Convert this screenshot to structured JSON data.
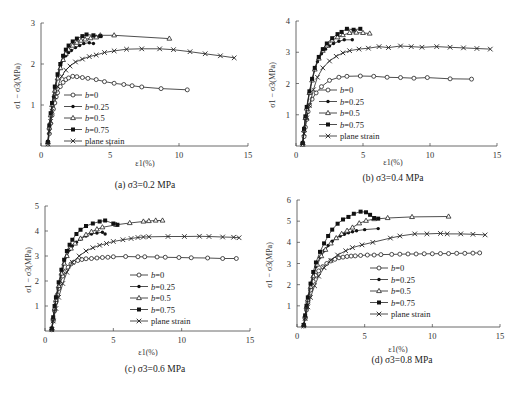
{
  "figure_caption": "",
  "chart_data": [
    {
      "id": "a",
      "type": "line",
      "title": "(a) σ3=0.2 MPa",
      "xlabel": "ε1(%)",
      "ylabel": "σ1 − σ3(MPa)",
      "xlim": [
        0,
        15
      ],
      "ylim": [
        0,
        3
      ],
      "xticks": [
        0,
        5,
        10,
        15
      ],
      "yticks": [
        1,
        2,
        3
      ],
      "grid": false,
      "legend_position": "lower-left-inside",
      "px": {
        "x0": 41,
        "x1": 248,
        "y0": 146,
        "y1": 23
      },
      "series": [
        {
          "name": "b=0",
          "marker": "open-circle",
          "x": [
            0.5,
            0.6,
            0.7,
            0.8,
            0.9,
            1.0,
            1.1,
            1.2,
            1.4,
            1.6,
            1.8,
            2.0,
            2.3,
            2.6,
            3.0,
            3.4,
            4.0,
            4.6,
            5.3,
            6.0,
            6.6,
            7.3,
            8.7,
            10.6
          ],
          "y": [
            0.05,
            0.3,
            0.55,
            0.75,
            0.9,
            1.05,
            1.2,
            1.3,
            1.45,
            1.55,
            1.62,
            1.66,
            1.7,
            1.69,
            1.67,
            1.65,
            1.62,
            1.57,
            1.53,
            1.5,
            1.47,
            1.44,
            1.4,
            1.37
          ]
        },
        {
          "name": "b=0.25",
          "marker": "filled-circle",
          "x": [
            0.5,
            0.6,
            0.7,
            0.8,
            0.9,
            1.0,
            1.2,
            1.4,
            1.6,
            1.8,
            2.0,
            2.2,
            2.5,
            2.8,
            3.1,
            3.5,
            3.8
          ],
          "y": [
            0.1,
            0.45,
            0.75,
            1.0,
            1.2,
            1.4,
            1.7,
            1.95,
            2.1,
            2.2,
            2.28,
            2.33,
            2.4,
            2.45,
            2.5,
            2.52,
            2.5
          ]
        },
        {
          "name": "b=0.5",
          "marker": "open-triangle",
          "x": [
            0.5,
            0.6,
            0.7,
            0.8,
            1.0,
            1.2,
            1.4,
            1.6,
            1.8,
            2.0,
            2.3,
            2.6,
            2.9,
            3.2,
            3.6,
            4.0,
            4.3,
            5.3,
            9.3
          ],
          "y": [
            0.1,
            0.45,
            0.75,
            1.0,
            1.35,
            1.65,
            1.9,
            2.1,
            2.25,
            2.35,
            2.45,
            2.52,
            2.57,
            2.6,
            2.63,
            2.65,
            2.7,
            2.7,
            2.62
          ]
        },
        {
          "name": "b=0.75",
          "marker": "filled-square",
          "x": [
            0.5,
            0.6,
            0.7,
            0.8,
            1.0,
            1.2,
            1.4,
            1.6,
            1.8,
            2.0,
            2.3,
            2.6,
            3.0,
            3.3,
            3.8,
            4.3
          ],
          "y": [
            0.1,
            0.5,
            0.8,
            1.05,
            1.45,
            1.75,
            2.0,
            2.2,
            2.35,
            2.45,
            2.55,
            2.62,
            2.68,
            2.72,
            2.7,
            2.68
          ]
        },
        {
          "name": "plane strain",
          "marker": "cross",
          "x": [
            0.5,
            0.6,
            0.7,
            0.8,
            1.0,
            1.2,
            1.5,
            1.8,
            2.1,
            2.5,
            3.0,
            3.5,
            4.0,
            4.6,
            5.3,
            6.2,
            7.3,
            8.6,
            9.6,
            10.8,
            11.9,
            13.0,
            14.0
          ],
          "y": [
            0.05,
            0.35,
            0.6,
            0.85,
            1.2,
            1.45,
            1.7,
            1.85,
            1.95,
            2.05,
            2.12,
            2.18,
            2.22,
            2.28,
            2.32,
            2.36,
            2.37,
            2.37,
            2.35,
            2.3,
            2.25,
            2.2,
            2.15
          ]
        }
      ]
    },
    {
      "id": "b",
      "type": "line",
      "title": "(b) σ3=0.4 MPa",
      "xlabel": "ε1(%)",
      "ylabel": "σ1 − σ3(MPa)",
      "xlim": [
        0,
        15
      ],
      "ylim": [
        0,
        4
      ],
      "xticks": [
        0,
        5,
        10,
        15
      ],
      "yticks": [
        1,
        2,
        3,
        4
      ],
      "grid": false,
      "legend_position": "lower-left-inside",
      "px": {
        "x0": 296,
        "x1": 497,
        "y0": 146,
        "y1": 21
      },
      "series": [
        {
          "name": "b=0",
          "marker": "open-circle",
          "x": [
            0.5,
            0.6,
            0.7,
            0.8,
            0.9,
            1.0,
            1.2,
            1.5,
            1.9,
            2.5,
            3.2,
            3.8,
            4.8,
            5.8,
            6.8,
            7.8,
            8.8,
            9.8,
            11.5,
            13.1
          ],
          "y": [
            0.05,
            0.3,
            0.6,
            0.85,
            1.1,
            1.3,
            1.5,
            1.7,
            1.9,
            2.1,
            2.2,
            2.23,
            2.24,
            2.23,
            2.2,
            2.19,
            2.17,
            2.19,
            2.15,
            2.14
          ]
        },
        {
          "name": "b=0.25",
          "marker": "filled-circle",
          "x": [
            0.5,
            0.6,
            0.7,
            0.8,
            1.0,
            1.2,
            1.4,
            1.6,
            1.9,
            2.2,
            2.5,
            2.8,
            3.2,
            3.6,
            4.2
          ],
          "y": [
            0.1,
            0.5,
            0.9,
            1.2,
            1.7,
            2.1,
            2.45,
            2.7,
            2.95,
            3.1,
            3.2,
            3.28,
            3.35,
            3.4,
            3.4
          ]
        },
        {
          "name": "b=0.5",
          "marker": "open-triangle",
          "x": [
            0.5,
            0.6,
            0.7,
            0.8,
            1.0,
            1.2,
            1.4,
            1.7,
            2.0,
            2.3,
            2.7,
            3.1,
            3.5,
            4.0,
            4.5,
            5.0,
            5.5
          ],
          "y": [
            0.1,
            0.5,
            0.9,
            1.2,
            1.7,
            2.1,
            2.45,
            2.8,
            3.05,
            3.22,
            3.38,
            3.48,
            3.55,
            3.62,
            3.63,
            3.62,
            3.6
          ]
        },
        {
          "name": "b=0.75",
          "marker": "filled-square",
          "x": [
            0.5,
            0.6,
            0.7,
            0.8,
            1.0,
            1.2,
            1.4,
            1.7,
            2.0,
            2.3,
            2.7,
            3.1,
            3.4,
            3.8,
            4.3,
            4.8
          ],
          "y": [
            0.1,
            0.55,
            0.95,
            1.25,
            1.75,
            2.15,
            2.5,
            2.85,
            3.1,
            3.28,
            3.45,
            3.58,
            3.65,
            3.75,
            3.72,
            3.75
          ]
        },
        {
          "name": "plane strain",
          "marker": "cross",
          "x": [
            0.5,
            0.6,
            0.8,
            1.0,
            1.3,
            1.6,
            2.0,
            2.5,
            3.0,
            3.5,
            4.0,
            4.7,
            5.4,
            6.2,
            6.9,
            7.8,
            8.6,
            9.4,
            10.5,
            11.5,
            12.5,
            13.5,
            14.5
          ],
          "y": [
            0.05,
            0.4,
            0.9,
            1.3,
            1.8,
            2.2,
            2.5,
            2.72,
            2.87,
            2.98,
            3.05,
            3.1,
            3.13,
            3.18,
            3.15,
            3.2,
            3.18,
            3.16,
            3.18,
            3.16,
            3.14,
            3.12,
            3.1
          ]
        }
      ]
    },
    {
      "id": "c",
      "type": "line",
      "title": "(c) σ3=0.6 MPa",
      "xlabel": "ε1(%)",
      "ylabel": "σ1 − σ3(MPa)",
      "xlim": [
        0,
        15
      ],
      "ylim": [
        0,
        5
      ],
      "xticks": [
        0,
        5,
        10,
        15
      ],
      "yticks": [
        1,
        2,
        3,
        4,
        5
      ],
      "grid": false,
      "legend_position": "lower-right-inside",
      "px": {
        "x0": 45,
        "x1": 250,
        "y0": 331,
        "y1": 206
      },
      "series": [
        {
          "name": "b=0",
          "marker": "open-circle",
          "x": [
            0.5,
            0.6,
            0.7,
            0.8,
            0.9,
            1.0,
            1.1,
            1.3,
            1.5,
            1.7,
            1.9,
            2.1,
            2.4,
            2.7,
            3.0,
            3.4,
            3.8,
            4.2,
            4.6,
            5.0,
            5.9,
            6.8,
            7.3,
            8.2,
            8.8,
            9.8,
            10.7,
            11.9,
            13.0,
            14.0
          ],
          "y": [
            0.05,
            0.4,
            0.8,
            1.15,
            1.45,
            1.7,
            1.9,
            2.2,
            2.4,
            2.55,
            2.68,
            2.75,
            2.82,
            2.86,
            2.89,
            2.9,
            2.92,
            2.94,
            2.95,
            2.97,
            2.98,
            2.97,
            2.97,
            2.96,
            2.95,
            2.94,
            2.93,
            2.92,
            2.9,
            2.9
          ]
        },
        {
          "name": "b=0.25",
          "marker": "filled-circle",
          "x": [
            0.5,
            0.6,
            0.7,
            0.8,
            1.0,
            1.2,
            1.4,
            1.6,
            1.8,
            2.0,
            2.3,
            2.6,
            3.0,
            3.4,
            3.8,
            4.2,
            4.4
          ],
          "y": [
            0.1,
            0.5,
            0.9,
            1.25,
            1.8,
            2.3,
            2.7,
            3.0,
            3.25,
            3.4,
            3.55,
            3.68,
            3.8,
            3.88,
            3.92,
            3.95,
            3.88
          ]
        },
        {
          "name": "b=0.5",
          "marker": "open-triangle",
          "x": [
            0.5,
            0.6,
            0.7,
            0.8,
            1.0,
            1.2,
            1.4,
            1.6,
            1.9,
            2.2,
            2.6,
            3.0,
            3.4,
            3.8,
            4.2,
            5.2,
            6.2,
            7.2,
            7.6,
            8.1,
            8.6
          ],
          "y": [
            0.1,
            0.5,
            0.9,
            1.25,
            1.8,
            2.3,
            2.7,
            3.0,
            3.3,
            3.5,
            3.7,
            3.85,
            3.97,
            4.07,
            4.15,
            4.25,
            4.32,
            4.38,
            4.4,
            4.42,
            4.42
          ]
        },
        {
          "name": "b=0.75",
          "marker": "filled-square",
          "x": [
            0.5,
            0.6,
            0.7,
            0.8,
            1.0,
            1.2,
            1.4,
            1.6,
            1.8,
            2.0,
            2.3,
            2.6,
            3.0,
            3.5,
            4.0,
            4.4,
            5.0,
            5.3
          ],
          "y": [
            0.1,
            0.55,
            1.0,
            1.35,
            1.95,
            2.45,
            2.85,
            3.2,
            3.45,
            3.65,
            3.88,
            4.05,
            4.2,
            4.3,
            4.38,
            4.42,
            4.3,
            4.25
          ]
        },
        {
          "name": "plane strain",
          "marker": "cross",
          "x": [
            0.5,
            0.6,
            0.8,
            1.0,
            1.3,
            1.6,
            2.0,
            2.5,
            3.0,
            3.5,
            4.0,
            4.5,
            5.0,
            5.7,
            6.3,
            6.8,
            7.2,
            7.6,
            9.0,
            10.2,
            11.3,
            12.0,
            13.0,
            13.8,
            14.2
          ],
          "y": [
            0.05,
            0.4,
            0.9,
            1.35,
            1.9,
            2.35,
            2.75,
            3.0,
            3.2,
            3.33,
            3.43,
            3.5,
            3.58,
            3.65,
            3.7,
            3.74,
            3.76,
            3.77,
            3.78,
            3.78,
            3.79,
            3.78,
            3.76,
            3.75,
            3.73
          ]
        }
      ]
    },
    {
      "id": "d",
      "type": "line",
      "title": "(d) σ3=0.8 MPa",
      "xlabel": "ε1(%)",
      "ylabel": "σ1 − σ3(MPa)",
      "xlim": [
        0,
        15
      ],
      "ylim": [
        0,
        6
      ],
      "xticks": [
        0,
        5,
        10,
        15
      ],
      "yticks": [
        1,
        2,
        3,
        4,
        5,
        6
      ],
      "grid": false,
      "legend_position": "lower-right-inside",
      "px": {
        "x0": 297,
        "x1": 500,
        "y0": 327,
        "y1": 200
      },
      "series": [
        {
          "name": "b=0",
          "marker": "open-circle",
          "x": [
            0.5,
            0.6,
            0.7,
            0.8,
            0.9,
            1.0,
            1.2,
            1.4,
            1.6,
            1.9,
            2.2,
            2.5,
            2.8,
            3.1,
            3.4,
            3.7,
            4.0,
            4.3,
            4.7,
            5.2,
            5.7,
            6.2,
            7.0,
            7.6,
            8.2,
            8.8,
            9.4,
            10.0,
            10.6,
            11.2,
            11.8,
            12.4,
            13.0,
            13.5
          ],
          "y": [
            0.05,
            0.4,
            0.8,
            1.15,
            1.45,
            1.75,
            2.15,
            2.45,
            2.65,
            2.85,
            3.0,
            3.12,
            3.2,
            3.27,
            3.3,
            3.33,
            3.35,
            3.36,
            3.38,
            3.4,
            3.4,
            3.42,
            3.43,
            3.44,
            3.45,
            3.45,
            3.46,
            3.46,
            3.47,
            3.47,
            3.48,
            3.48,
            3.49,
            3.5
          ]
        },
        {
          "name": "b=0.25",
          "marker": "filled-circle",
          "x": [
            0.5,
            0.6,
            0.7,
            0.8,
            1.0,
            1.2,
            1.4,
            1.7,
            2.0,
            2.3,
            2.6,
            2.9,
            3.2,
            3.5,
            3.8,
            4.1,
            4.4,
            5.0,
            6.0
          ],
          "y": [
            0.1,
            0.5,
            0.95,
            1.3,
            1.9,
            2.4,
            2.85,
            3.3,
            3.6,
            3.85,
            4.05,
            4.2,
            4.3,
            4.38,
            4.45,
            4.5,
            4.55,
            4.6,
            4.65
          ]
        },
        {
          "name": "b=0.5",
          "marker": "open-triangle",
          "x": [
            0.5,
            0.6,
            0.7,
            0.8,
            1.0,
            1.2,
            1.5,
            1.8,
            2.1,
            2.5,
            2.9,
            3.3,
            3.7,
            4.1,
            4.6,
            5.1,
            5.7,
            6.7,
            8.5,
            11.2
          ],
          "y": [
            0.1,
            0.5,
            0.95,
            1.3,
            1.9,
            2.4,
            2.95,
            3.35,
            3.65,
            3.95,
            4.2,
            4.4,
            4.55,
            4.7,
            4.9,
            5.02,
            5.1,
            5.15,
            5.2,
            5.22
          ]
        },
        {
          "name": "b=0.75",
          "marker": "filled-square",
          "x": [
            0.5,
            0.6,
            0.7,
            0.8,
            1.0,
            1.2,
            1.4,
            1.7,
            2.0,
            2.3,
            2.6,
            3.0,
            3.4,
            3.8,
            4.2,
            4.7,
            5.1,
            5.4,
            5.7,
            6.0
          ],
          "y": [
            0.1,
            0.55,
            1.0,
            1.4,
            2.05,
            2.6,
            3.05,
            3.55,
            3.95,
            4.3,
            4.6,
            4.88,
            5.08,
            5.2,
            5.35,
            5.45,
            5.42,
            5.3,
            5.15,
            5.12
          ]
        },
        {
          "name": "plane strain",
          "marker": "cross",
          "x": [
            0.5,
            0.6,
            0.8,
            1.0,
            1.3,
            1.6,
            2.0,
            2.5,
            3.0,
            3.6,
            4.1,
            4.8,
            5.6,
            6.9,
            7.6,
            8.7,
            9.6,
            10.6,
            11.1,
            12.1,
            13.0,
            13.9
          ],
          "y": [
            0.05,
            0.4,
            0.95,
            1.4,
            1.95,
            2.4,
            2.8,
            3.15,
            3.4,
            3.6,
            3.75,
            3.88,
            4.0,
            4.2,
            4.3,
            4.4,
            4.4,
            4.42,
            4.4,
            4.4,
            4.38,
            4.35
          ]
        }
      ]
    }
  ]
}
